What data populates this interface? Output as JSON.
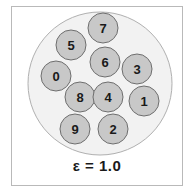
{
  "figure": {
    "caption": "ε = 1.0",
    "container": {
      "name": "cluster-boundary-ellipse",
      "cx": 100,
      "cy": 83.5,
      "rx": 72,
      "ry": 71.5,
      "fill": "#f2f2f2",
      "stroke": "#b0b0b0"
    },
    "frame": {
      "stroke": "#b9b9b9",
      "fill": "#ffffff"
    },
    "node_style": {
      "fill": "#c8c8c8",
      "stroke": "#6e6e6e",
      "radius": 15,
      "text_color": "#1a1a1a"
    },
    "nodes": [
      {
        "label": "7",
        "cx": 103,
        "cy": 28
      },
      {
        "label": "5",
        "cx": 71,
        "cy": 45
      },
      {
        "label": "6",
        "cx": 105,
        "cy": 62
      },
      {
        "label": "0",
        "cx": 56,
        "cy": 76
      },
      {
        "label": "3",
        "cx": 137,
        "cy": 69
      },
      {
        "label": "8",
        "cx": 80,
        "cy": 97
      },
      {
        "label": "4",
        "cx": 108,
        "cy": 97
      },
      {
        "label": "1",
        "cx": 144,
        "cy": 101
      },
      {
        "label": "9",
        "cx": 75,
        "cy": 129
      },
      {
        "label": "2",
        "cx": 113,
        "cy": 129
      }
    ]
  }
}
